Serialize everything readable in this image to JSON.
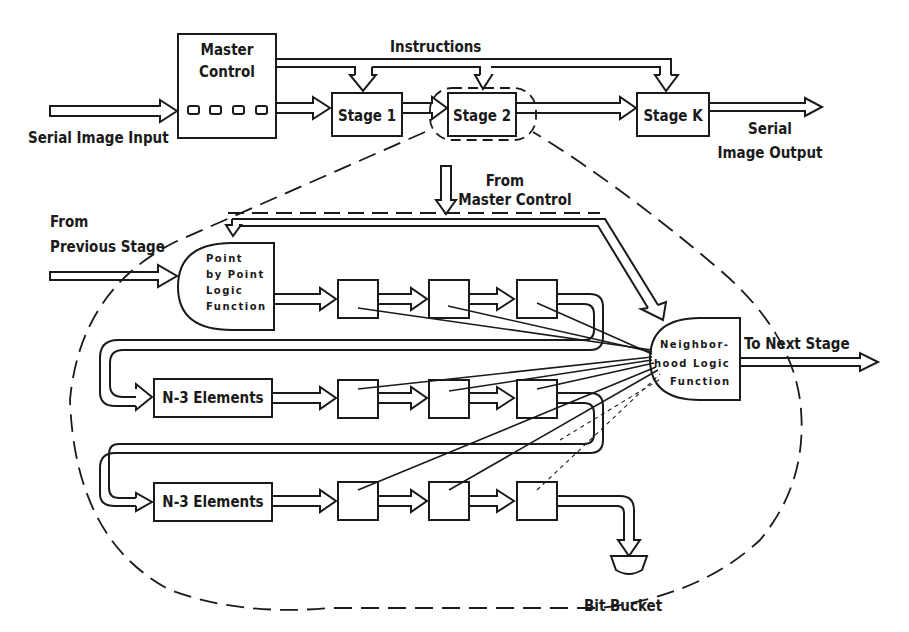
{
  "diagram": {
    "top_row": {
      "input_label": "Serial Image Input",
      "master_control_line1": "Master",
      "master_control_line2": "Control",
      "instructions_label": "Instructions",
      "stages": [
        "Stage 1",
        "Stage 2",
        "Stage K"
      ],
      "output_label_line1": "Serial",
      "output_label_line2": "Image Output"
    },
    "detail": {
      "from_master_line1": "From",
      "from_master_line2": "Master Control",
      "from_previous_line1": "From",
      "from_previous_line2": "Previous Stage",
      "point_logic_lines": [
        "Point",
        "by Point",
        "Logic",
        "Function"
      ],
      "neighborhood_lines": [
        "Neighbor-",
        "hood Logic",
        "Function"
      ],
      "to_next_stage": "To Next Stage",
      "delay_line_label": "N-3 Elements",
      "delay_line_label_2": "N-3 Elements",
      "bit_bucket": "Bit Bucket"
    }
  }
}
